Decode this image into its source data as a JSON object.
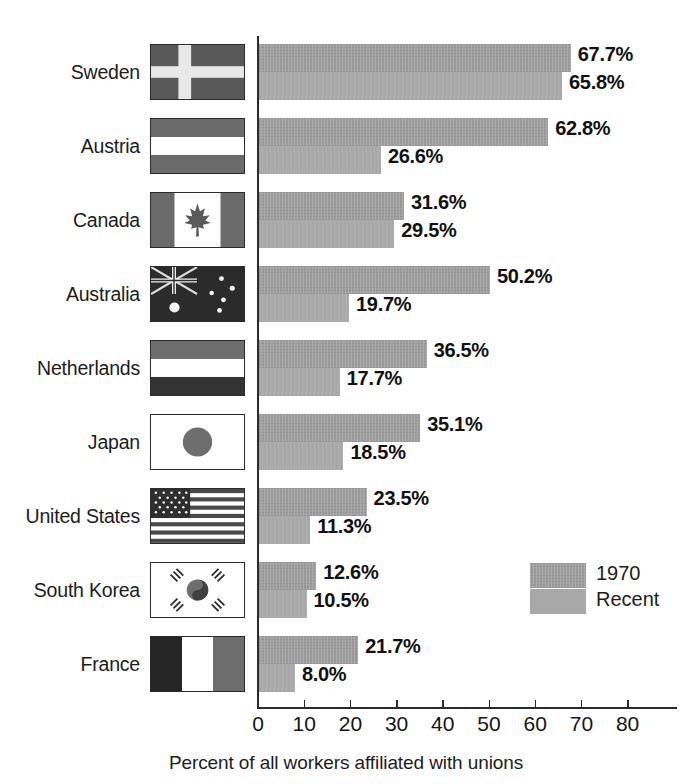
{
  "chart_data": {
    "type": "bar",
    "orientation": "horizontal",
    "title": "",
    "xlabel": "Percent of all workers affiliated with unions",
    "ylabel": "",
    "xlim": [
      0,
      90
    ],
    "xticks": [
      "0",
      "10",
      "20",
      "30",
      "40",
      "50",
      "60",
      "70",
      "80"
    ],
    "xtick_values": [
      0,
      10,
      20,
      30,
      40,
      50,
      60,
      70,
      80
    ],
    "grid": false,
    "legend_position": "inside-right",
    "categories": [
      "Sweden",
      "Austria",
      "Canada",
      "Australia",
      "Netherlands",
      "Japan",
      "United States",
      "South Korea",
      "France"
    ],
    "series": [
      {
        "name": "1970",
        "color": "#9d9d9d",
        "values": [
          67.7,
          62.8,
          31.6,
          50.2,
          36.5,
          35.1,
          23.5,
          12.6,
          21.7
        ]
      },
      {
        "name": "Recent",
        "color": "#a8a8a8",
        "values": [
          65.8,
          26.6,
          29.5,
          19.7,
          17.7,
          18.5,
          11.3,
          10.5,
          8.0
        ]
      }
    ],
    "value_labels": [
      {
        "old": "67.7%",
        "recent": "65.8%"
      },
      {
        "old": "62.8%",
        "recent": "26.6%"
      },
      {
        "old": "31.6%",
        "recent": "29.5%"
      },
      {
        "old": "50.2%",
        "recent": "19.7%"
      },
      {
        "old": "36.5%",
        "recent": "17.7%"
      },
      {
        "old": "35.1%",
        "recent": "18.5%"
      },
      {
        "old": "23.5%",
        "recent": "11.3%"
      },
      {
        "old": "12.6%",
        "recent": "10.5%"
      },
      {
        "old": "21.7%",
        "recent": "8.0%"
      }
    ]
  },
  "rows": [
    {
      "country": "Sweden",
      "flag": "flag-sweden",
      "old": "67.7%",
      "recent": "65.8%"
    },
    {
      "country": "Austria",
      "flag": "flag-austria",
      "old": "62.8%",
      "recent": "26.6%"
    },
    {
      "country": "Canada",
      "flag": "flag-canada",
      "old": "31.6%",
      "recent": "29.5%"
    },
    {
      "country": "Australia",
      "flag": "flag-australia",
      "old": "50.2%",
      "recent": "19.7%"
    },
    {
      "country": "Netherlands",
      "flag": "flag-netherlands",
      "old": "36.5%",
      "recent": "17.7%"
    },
    {
      "country": "Japan",
      "flag": "flag-japan",
      "old": "35.1%",
      "recent": "18.5%"
    },
    {
      "country": "United States",
      "flag": "flag-united-states",
      "old": "23.5%",
      "recent": "11.3%"
    },
    {
      "country": "South Korea",
      "flag": "flag-south-korea",
      "old": "12.6%",
      "recent": "10.5%"
    },
    {
      "country": "France",
      "flag": "flag-france",
      "old": "21.7%",
      "recent": "8.0%"
    }
  ],
  "legend": {
    "items": [
      {
        "label": "1970",
        "color": "#9d9d9d"
      },
      {
        "label": "Recent",
        "color": "#a8a8a8"
      }
    ]
  },
  "axis": {
    "xlabel": "Percent of all workers affiliated with unions",
    "ticks": [
      "0",
      "10",
      "20",
      "30",
      "40",
      "50",
      "60",
      "70",
      "80"
    ]
  }
}
